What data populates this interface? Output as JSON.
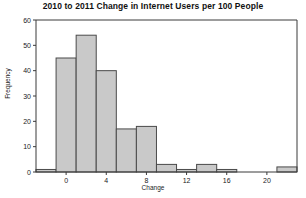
{
  "chart_data": {
    "type": "bar",
    "title": "2010 to 2011 Change in Internet Users per 100 People",
    "xlabel": "Change",
    "ylabel": "Frequency",
    "xlim": [
      -3,
      23
    ],
    "ylim": [
      0,
      60
    ],
    "bin_width": 2,
    "grid": false,
    "legend": null,
    "categories": [
      "-3 to -1",
      "-1 to 1",
      "1 to 3",
      "3 to 5",
      "5 to 7",
      "7 to 9",
      "9 to 11",
      "11 to 13",
      "13 to 15",
      "15 to 17",
      "17 to 19",
      "19 to 21",
      "21 to 23"
    ],
    "bin_starts": [
      -3,
      -1,
      1,
      3,
      5,
      7,
      9,
      11,
      13,
      15,
      17,
      19,
      21
    ],
    "values": [
      1,
      45,
      54,
      40,
      17,
      18,
      3,
      1,
      3,
      1,
      0,
      0,
      2
    ],
    "xticks": [
      0,
      4,
      8,
      12,
      16,
      20
    ],
    "xtick_labels": [
      "0",
      "4",
      "8",
      "12",
      "16",
      "20"
    ],
    "yticks": [
      0,
      10,
      20,
      30,
      40,
      50,
      60
    ],
    "ytick_labels": [
      "0",
      "10",
      "20",
      "30",
      "40",
      "50",
      "60"
    ],
    "bar_fill": "#c9c9c9",
    "bar_stroke": "#4a4a4a",
    "axis_color": "#3a3a3a"
  }
}
